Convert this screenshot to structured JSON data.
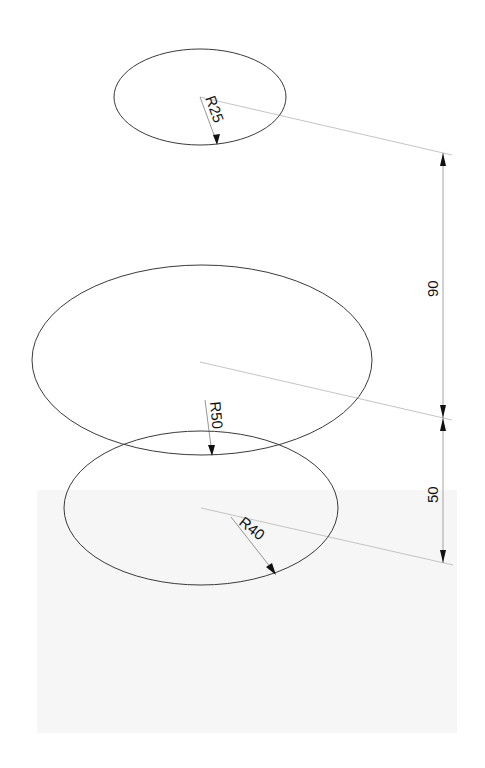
{
  "drawing": {
    "type": "isometric technical drawing",
    "colors": {
      "background": "#ffffff",
      "panel": "#f6f6f6",
      "outline": "#3a3a3a",
      "dimension_line": "#9a9a9a",
      "extension_line": "#bdbdbd",
      "text": "#111111"
    },
    "circles": [
      {
        "id": "top",
        "label": "R25",
        "radius": 25,
        "cx": 200,
        "cy": 97,
        "rx": 86,
        "ry": 48
      },
      {
        "id": "middle",
        "label": "R50",
        "radius": 50,
        "cx": 202,
        "cy": 360,
        "rx": 170,
        "ry": 95
      },
      {
        "id": "bottom",
        "label": "R40",
        "radius": 40,
        "cx": 201,
        "cy": 508,
        "rx": 137,
        "ry": 77
      }
    ],
    "dimensions": [
      {
        "id": "upper-spacing",
        "label": "90",
        "value": 90
      },
      {
        "id": "lower-spacing",
        "label": "50",
        "value": 50
      }
    ]
  }
}
